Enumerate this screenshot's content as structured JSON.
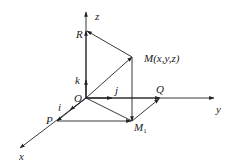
{
  "diagram": {
    "type": "3d-coordinate-system",
    "axes": {
      "x": {
        "label": "x"
      },
      "y": {
        "label": "y"
      },
      "z": {
        "label": "z"
      }
    },
    "origin": {
      "label": "O"
    },
    "points": {
      "R": {
        "label": "R"
      },
      "M": {
        "label": "M(x,y,z)"
      },
      "Q": {
        "label": "Q"
      },
      "P": {
        "label": "P"
      },
      "M1": {
        "label": "M",
        "subscript": "1"
      }
    },
    "unit_vectors": {
      "i": {
        "label": "i"
      },
      "j": {
        "label": "j"
      },
      "k": {
        "label": "k"
      }
    }
  }
}
